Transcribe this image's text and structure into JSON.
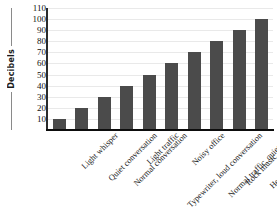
{
  "chart_data": {
    "type": "bar",
    "title": "",
    "xlabel": "",
    "ylabel": "Decibels",
    "categories": [
      "Light whisper",
      "Quiet conversation",
      "Normal conversation",
      "Light traffic",
      "Typewriter, loud conversation",
      "Noisy office",
      "Normal traffic, quiet train",
      "Rock music, subway",
      "Heavy traffic, thunder",
      "Jet plane at takeoff"
    ],
    "values": [
      10,
      20,
      30,
      40,
      50,
      60,
      70,
      80,
      90,
      100
    ],
    "ylim": [
      0,
      110
    ],
    "yticks": [
      10,
      20,
      30,
      40,
      50,
      60,
      70,
      80,
      90,
      100,
      110
    ],
    "ytick_labels": [
      "10",
      "20",
      "30",
      "40",
      "50",
      "60",
      "70",
      "80",
      "90",
      "100",
      "110"
    ],
    "grid": true,
    "legend": false,
    "bar_color": "#4b4b4b",
    "gridline_color": "#e9e9e9",
    "axis_color": "#0d0d0d",
    "background_color": "#ffffff"
  }
}
